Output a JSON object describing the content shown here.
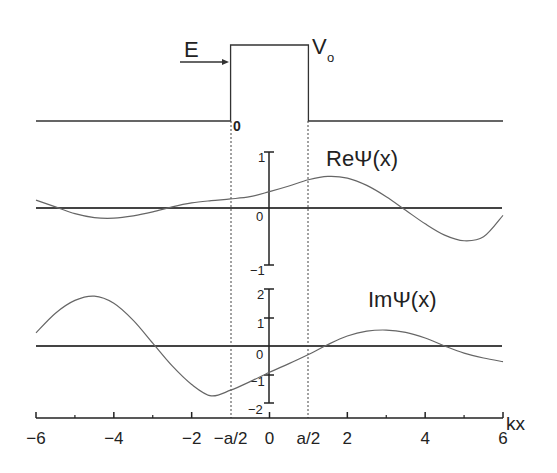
{
  "chart_data": {
    "type": "line",
    "title": "",
    "xlabel": "kx",
    "xlim": [
      -6,
      6
    ],
    "x_ticks": [
      -6,
      -4,
      -2,
      0,
      2,
      4,
      6
    ],
    "x_minor_ticks": [
      -5,
      -3,
      3,
      5
    ],
    "x_special_labels": [
      {
        "label": "−a/2",
        "x": -1.0
      },
      {
        "label": "0",
        "x": 0
      },
      {
        "label": "a/2",
        "x": 1.0
      }
    ],
    "barrier": {
      "label_energy": "E",
      "label_potential": "V",
      "label_potential_sub": "o",
      "label_origin": "0",
      "x_left": -1.0,
      "x_right": 1.0
    },
    "panels": [
      {
        "name": "Re",
        "label": "ReΨ(x)",
        "ylim": [
          -1,
          1
        ],
        "y_ticks": [
          {
            "value": 1,
            "label": "1"
          },
          {
            "value": 0,
            "label": "0"
          },
          {
            "value": -1,
            "label": "−1"
          }
        ],
        "series": {
          "x": [
            -6,
            -5.5,
            -5,
            -4.5,
            -4,
            -3.5,
            -3,
            -2.5,
            -2,
            -1.5,
            -1,
            -0.5,
            0,
            0.5,
            1,
            1.5,
            2,
            2.5,
            3,
            3.5,
            4,
            4.5,
            5,
            5.5,
            6
          ],
          "y": [
            0.14,
            0.02,
            -0.1,
            -0.17,
            -0.18,
            -0.14,
            -0.07,
            0.02,
            0.09,
            0.13,
            0.16,
            0.2,
            0.29,
            0.39,
            0.5,
            0.56,
            0.53,
            0.4,
            0.2,
            -0.04,
            -0.28,
            -0.48,
            -0.58,
            -0.51,
            -0.13
          ]
        }
      },
      {
        "name": "Im",
        "label": "ImΨ(x)",
        "ylim": [
          -2,
          2
        ],
        "y_ticks": [
          {
            "value": 2,
            "label": "2"
          },
          {
            "value": 1,
            "label": "1"
          },
          {
            "value": 0,
            "label": "0"
          },
          {
            "value": -1,
            "label": "−1"
          },
          {
            "value": -2,
            "label": "−2"
          }
        ],
        "series": {
          "x": [
            -6,
            -5.5,
            -5,
            -4.5,
            -4,
            -3.5,
            -3,
            -2.5,
            -2,
            -1.5,
            -1,
            -0.5,
            0,
            0.5,
            1,
            1.5,
            2,
            2.5,
            3,
            3.5,
            4,
            4.5,
            5,
            5.5,
            6
          ],
          "y": [
            0.46,
            1.15,
            1.6,
            1.75,
            1.5,
            0.9,
            0.1,
            -0.7,
            -1.35,
            -1.75,
            -1.55,
            -1.25,
            -0.92,
            -0.62,
            -0.3,
            0.05,
            0.35,
            0.52,
            0.56,
            0.48,
            0.28,
            0.0,
            -0.25,
            -0.42,
            -0.55
          ]
        }
      }
    ]
  }
}
